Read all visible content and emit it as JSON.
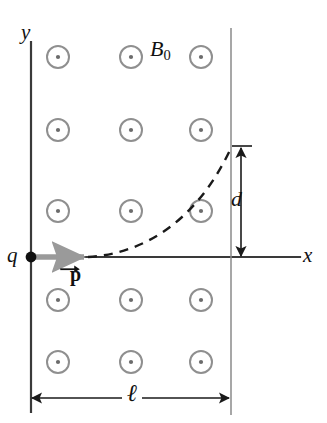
{
  "figure": {
    "background_color": "#ffffff"
  },
  "labels": {
    "y_axis": "y",
    "x_axis": "x",
    "charge": "q",
    "field": "B",
    "field_subscript": "0",
    "momentum": "p",
    "depth": "d",
    "length": "ℓ"
  },
  "colors": {
    "axis": "#3a3a3a",
    "field_circle": "#8f8f8f",
    "field_dot": "#6b6b6b",
    "momentum_arrow": "#9a9a9a",
    "charge_dot": "#101010",
    "trajectory": "#1a1a1a",
    "dimension": "#1a1a1a",
    "boundary": "#8a8a8a"
  },
  "geometry": {
    "origin": {
      "x": 31,
      "y": 257
    },
    "x_axis_end": {
      "x": 300,
      "y": 257
    },
    "y_axis_top": {
      "x": 31,
      "y": 42
    },
    "y_axis_bottom": {
      "x": 31,
      "y": 412
    },
    "boundary_line_x": 231,
    "boundary_top_y": 28,
    "boundary_bottom_y": 415,
    "momentum_arrow": {
      "x1": 33,
      "y1": 257,
      "x2": 88,
      "y2": 257
    },
    "trajectory_start": {
      "x": 88,
      "y": 257
    },
    "trajectory_end": {
      "x": 231,
      "y": 148
    },
    "depth_arrow": {
      "x": 241,
      "y_top": 148,
      "y_bottom": 255
    },
    "length_arrow": {
      "y": 398,
      "x_left": 31,
      "x_right": 230
    },
    "field_circle_radius": 11,
    "field_dot_radius": 2
  },
  "field_markers": {
    "symbol": "dot-in-circle",
    "meaning": "magnetic field out of page",
    "columns_x": [
      58,
      131,
      201
    ],
    "rows_y": [
      57,
      130,
      211,
      300,
      362
    ]
  },
  "label_positions": {
    "y_axis": {
      "x": 22,
      "y": 25
    },
    "x_axis": {
      "x": 303,
      "y": 247
    },
    "charge": {
      "x": 8,
      "y": 246
    },
    "field": {
      "x": 150,
      "y": 42
    },
    "momentum": {
      "x": 70,
      "y": 267
    },
    "depth": {
      "x": 232,
      "y": 192
    },
    "length": {
      "x": 123,
      "y": 382
    }
  }
}
